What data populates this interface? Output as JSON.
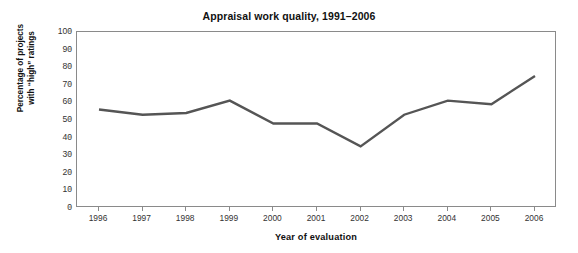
{
  "chart_data": {
    "type": "line",
    "title": "Appraisal work quality, 1991–2006",
    "xlabel": "Year of evaluation",
    "ylabel_line1": "Percentage of projects",
    "ylabel_line2": "with “high” ratings",
    "categories": [
      "1996",
      "1997",
      "1998",
      "1999",
      "2000",
      "2001",
      "2002",
      "2003",
      "2004",
      "2005",
      "2006"
    ],
    "values": [
      56,
      53,
      54,
      61,
      48,
      48,
      35,
      53,
      61,
      59,
      75
    ],
    "series": [
      {
        "name": "Percentage of projects with \"high\" ratings",
        "values": [
          56,
          53,
          54,
          61,
          48,
          48,
          35,
          53,
          61,
          59,
          75
        ]
      }
    ],
    "ylim": [
      0,
      100
    ],
    "y_ticks": [
      0,
      10,
      20,
      30,
      40,
      50,
      60,
      70,
      80,
      90,
      100
    ],
    "y_tick_labels": [
      "0",
      "10",
      "20",
      "30",
      "40",
      "50",
      "60",
      "70",
      "80",
      "90",
      "100"
    ],
    "grid": false,
    "legend": "none",
    "line_color": "#555555",
    "axis_color": "#8a8a8a",
    "background_color": "#ffffff"
  }
}
